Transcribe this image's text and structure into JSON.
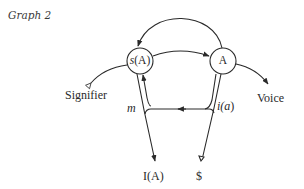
{
  "title": "Graph 2",
  "nodes": {
    "sA": {
      "prefix": "s",
      "rest": "(A)"
    },
    "A": {
      "label": "A"
    }
  },
  "labels": {
    "signifier": "Signifier",
    "voice": "Voice",
    "m": "m",
    "i_a_prefix": "i(",
    "i_a_var": "a",
    "i_a_suffix": ")",
    "IA": "I(A)",
    "barred_S": "$"
  },
  "colors": {
    "stroke": "#2a2a2a",
    "text": "#2a2a2a",
    "background": "#ffffff"
  }
}
